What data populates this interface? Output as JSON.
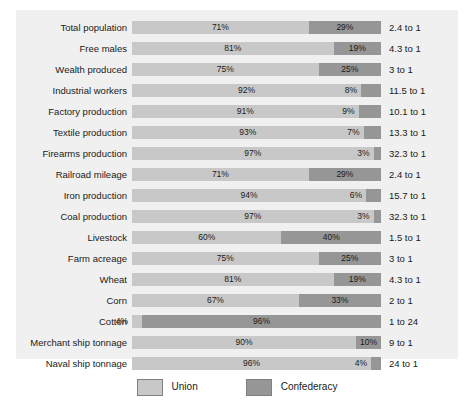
{
  "chart_data": {
    "type": "bar",
    "subtype": "stacked-horizontal-100-percent",
    "title": "",
    "subtitle": "",
    "xlabel": "",
    "ylabel": "",
    "xlim": [
      0,
      100
    ],
    "grid": false,
    "legend_position": "bottom-center",
    "categories": [
      "Total population",
      "Free males",
      "Wealth produced",
      "Industrial workers",
      "Factory production",
      "Textile production",
      "Firearms production",
      "Railroad mileage",
      "Iron production",
      "Coal production",
      "Livestock",
      "Farm acreage",
      "Wheat",
      "Corn",
      "Cotton",
      "Merchant ship tonnage",
      "Naval ship tonnage"
    ],
    "series": [
      {
        "name": "Union",
        "color": "#c8c8c8",
        "values": [
          71,
          81,
          75,
          92,
          91,
          93,
          97,
          71,
          94,
          97,
          60,
          75,
          81,
          67,
          4,
          90,
          96
        ]
      },
      {
        "name": "Confederacy",
        "color": "#969696",
        "values": [
          29,
          19,
          25,
          8,
          9,
          7,
          3,
          29,
          6,
          3,
          40,
          25,
          19,
          33,
          96,
          10,
          4
        ]
      }
    ],
    "value_labels": {
      "union": [
        "71%",
        "81%",
        "75%",
        "92%",
        "91%",
        "93%",
        "97%",
        "71%",
        "94%",
        "97%",
        "60%",
        "75%",
        "81%",
        "67%",
        "4%",
        "90%",
        "96%"
      ],
      "confederacy": [
        "29%",
        "19%",
        "25%",
        "8%",
        "9%",
        "7%",
        "3%",
        "29%",
        "6%",
        "3%",
        "40%",
        "25%",
        "19%",
        "33%",
        "96%",
        "10%",
        "4%"
      ]
    },
    "annotations": [
      "2.4 to 1",
      "4.3 to 1",
      "3 to 1",
      "11.5 to 1",
      "10.1 to 1",
      "13.3 to 1",
      "32.3 to 1",
      "2.4 to 1",
      "15.7 to 1",
      "32.3 to 1",
      "1.5 to 1",
      "3 to 1",
      "4.3 to 1",
      "2 to 1",
      "1 to 24",
      "9 to 1",
      "24 to 1"
    ]
  },
  "rows": [
    {
      "label": "Total population",
      "union": 71,
      "confederacy": 29,
      "union_label": "71%",
      "confederacy_label": "29%",
      "ratio": "2.4 to 1",
      "union_outside": false,
      "conf_outside": false
    },
    {
      "label": "Free males",
      "union": 81,
      "confederacy": 19,
      "union_label": "81%",
      "confederacy_label": "19%",
      "ratio": "4.3 to 1",
      "union_outside": false,
      "conf_outside": false
    },
    {
      "label": "Wealth produced",
      "union": 75,
      "confederacy": 25,
      "union_label": "75%",
      "confederacy_label": "25%",
      "ratio": "3 to 1",
      "union_outside": false,
      "conf_outside": false
    },
    {
      "label": "Industrial workers",
      "union": 92,
      "confederacy": 8,
      "union_label": "92%",
      "confederacy_label": "8%",
      "ratio": "11.5 to 1",
      "union_outside": false,
      "conf_outside": true
    },
    {
      "label": "Factory production",
      "union": 91,
      "confederacy": 9,
      "union_label": "91%",
      "confederacy_label": "9%",
      "ratio": "10.1 to 1",
      "union_outside": false,
      "conf_outside": true
    },
    {
      "label": "Textile production",
      "union": 93,
      "confederacy": 7,
      "union_label": "93%",
      "confederacy_label": "7%",
      "ratio": "13.3 to 1",
      "union_outside": false,
      "conf_outside": true
    },
    {
      "label": "Firearms production",
      "union": 97,
      "confederacy": 3,
      "union_label": "97%",
      "confederacy_label": "3%",
      "ratio": "32.3 to 1",
      "union_outside": false,
      "conf_outside": true,
      "conf_leader": true
    },
    {
      "label": "Railroad mileage",
      "union": 71,
      "confederacy": 29,
      "union_label": "71%",
      "confederacy_label": "29%",
      "ratio": "2.4 to 1",
      "union_outside": false,
      "conf_outside": false
    },
    {
      "label": "Iron production",
      "union": 94,
      "confederacy": 6,
      "union_label": "94%",
      "confederacy_label": "6%",
      "ratio": "15.7 to 1",
      "union_outside": false,
      "conf_outside": true
    },
    {
      "label": "Coal production",
      "union": 97,
      "confederacy": 3,
      "union_label": "97%",
      "confederacy_label": "3%",
      "ratio": "32.3 to 1",
      "union_outside": false,
      "conf_outside": true,
      "conf_leader": true
    },
    {
      "label": "Livestock",
      "union": 60,
      "confederacy": 40,
      "union_label": "60%",
      "confederacy_label": "40%",
      "ratio": "1.5 to 1",
      "union_outside": false,
      "conf_outside": false
    },
    {
      "label": "Farm acreage",
      "union": 75,
      "confederacy": 25,
      "union_label": "75%",
      "confederacy_label": "25%",
      "ratio": "3 to 1",
      "union_outside": false,
      "conf_outside": false
    },
    {
      "label": "Wheat",
      "union": 81,
      "confederacy": 19,
      "union_label": "81%",
      "confederacy_label": "19%",
      "ratio": "4.3 to 1",
      "union_outside": false,
      "conf_outside": false
    },
    {
      "label": "Corn",
      "union": 67,
      "confederacy": 33,
      "union_label": "67%",
      "confederacy_label": "33%",
      "ratio": "2 to 1",
      "union_outside": false,
      "conf_outside": false
    },
    {
      "label": "Cotton",
      "union": 4,
      "confederacy": 96,
      "union_label": "4%",
      "confederacy_label": "96%",
      "ratio": "1 to 24",
      "union_outside": true,
      "union_leader": true,
      "conf_outside": false
    },
    {
      "label": "Merchant ship tonnage",
      "union": 90,
      "confederacy": 10,
      "union_label": "90%",
      "confederacy_label": "10%",
      "ratio": "9 to 1",
      "union_outside": false,
      "conf_outside": false
    },
    {
      "label": "Naval ship tonnage",
      "union": 96,
      "confederacy": 4,
      "union_label": "96%",
      "confederacy_label": "4%",
      "ratio": "24 to 1",
      "union_outside": false,
      "conf_outside": true,
      "conf_leader": true
    }
  ],
  "legend": {
    "items": [
      {
        "label": "Union",
        "color": "#c8c8c8"
      },
      {
        "label": "Confederacy",
        "color": "#969696"
      }
    ]
  },
  "colors": {
    "union": "#c8c8c8",
    "confederacy": "#969696",
    "panel_background": "#f0f0f0",
    "figure_background": "#ffffff",
    "text": "#1a1a1a"
  }
}
